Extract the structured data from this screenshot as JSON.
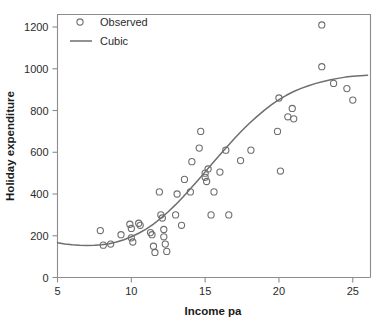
{
  "chart_data": {
    "type": "scatter",
    "title": "",
    "xlabel": "Income pa",
    "ylabel": "Holiday expenditure",
    "xlim": [
      5,
      26.2
    ],
    "ylim": [
      0,
      1260
    ],
    "xticks": [
      5,
      10,
      15,
      20,
      25
    ],
    "xtick_labels": [
      "5",
      "10",
      "15",
      "20",
      "25"
    ],
    "yticks": [
      0,
      200,
      400,
      600,
      800,
      1000,
      1200
    ],
    "ytick_labels": [
      "0",
      "200",
      "400",
      "600",
      "800",
      "1000",
      "1200"
    ],
    "grid": false,
    "legend_position": "top-left inside",
    "series": [
      {
        "name": "Observed",
        "type": "scatter",
        "marker": "open-circle",
        "color": "#6e6e6e",
        "points": [
          [
            7.9,
            225
          ],
          [
            8.1,
            155
          ],
          [
            8.6,
            160
          ],
          [
            9.3,
            205
          ],
          [
            9.9,
            255
          ],
          [
            10.0,
            235
          ],
          [
            10.0,
            190
          ],
          [
            10.1,
            170
          ],
          [
            10.5,
            260
          ],
          [
            10.6,
            250
          ],
          [
            11.3,
            215
          ],
          [
            11.4,
            205
          ],
          [
            11.5,
            150
          ],
          [
            11.6,
            120
          ],
          [
            11.9,
            410
          ],
          [
            12.0,
            300
          ],
          [
            12.1,
            285
          ],
          [
            12.2,
            230
          ],
          [
            12.2,
            195
          ],
          [
            12.3,
            160
          ],
          [
            12.4,
            125
          ],
          [
            13.0,
            300
          ],
          [
            13.1,
            400
          ],
          [
            13.4,
            250
          ],
          [
            13.6,
            470
          ],
          [
            14.0,
            410
          ],
          [
            14.1,
            555
          ],
          [
            14.6,
            620
          ],
          [
            14.7,
            700
          ],
          [
            15.0,
            480
          ],
          [
            15.0,
            500
          ],
          [
            15.1,
            460
          ],
          [
            15.2,
            520
          ],
          [
            15.4,
            300
          ],
          [
            15.6,
            410
          ],
          [
            16.0,
            505
          ],
          [
            16.4,
            610
          ],
          [
            16.6,
            300
          ],
          [
            17.4,
            560
          ],
          [
            18.1,
            610
          ],
          [
            19.9,
            700
          ],
          [
            20.0,
            860
          ],
          [
            20.1,
            510
          ],
          [
            20.6,
            770
          ],
          [
            20.9,
            810
          ],
          [
            21.0,
            760
          ],
          [
            22.9,
            1210
          ],
          [
            22.9,
            1010
          ],
          [
            23.7,
            930
          ],
          [
            24.6,
            905
          ],
          [
            25.0,
            850
          ]
        ]
      },
      {
        "name": "Cubic",
        "type": "line",
        "color": "#6e6e6e",
        "points": [
          [
            5.0,
            167
          ],
          [
            5.5,
            161
          ],
          [
            6.0,
            157
          ],
          [
            6.5,
            154
          ],
          [
            7.0,
            153
          ],
          [
            7.5,
            154
          ],
          [
            8.0,
            157
          ],
          [
            8.5,
            162
          ],
          [
            9.0,
            170
          ],
          [
            9.5,
            181
          ],
          [
            10.0,
            195
          ],
          [
            10.5,
            212
          ],
          [
            11.0,
            232
          ],
          [
            11.5,
            256
          ],
          [
            12.0,
            284
          ],
          [
            12.5,
            315
          ],
          [
            13.0,
            349
          ],
          [
            13.5,
            386
          ],
          [
            14.0,
            425
          ],
          [
            14.5,
            465
          ],
          [
            15.0,
            506
          ],
          [
            15.5,
            547
          ],
          [
            16.0,
            588
          ],
          [
            16.5,
            628
          ],
          [
            17.0,
            667
          ],
          [
            17.5,
            704
          ],
          [
            18.0,
            739
          ],
          [
            18.5,
            771
          ],
          [
            19.0,
            801
          ],
          [
            19.5,
            828
          ],
          [
            20.0,
            852
          ],
          [
            20.5,
            873
          ],
          [
            21.0,
            891
          ],
          [
            21.5,
            906
          ],
          [
            22.0,
            919
          ],
          [
            22.5,
            930
          ],
          [
            23.0,
            939
          ],
          [
            23.5,
            947
          ],
          [
            24.0,
            954
          ],
          [
            24.5,
            960
          ],
          [
            25.0,
            964
          ],
          [
            25.5,
            967
          ],
          [
            26.0,
            969
          ]
        ]
      }
    ],
    "legend": [
      {
        "label": "Observed",
        "marker": "open-circle"
      },
      {
        "label": "Cubic",
        "marker": "line"
      }
    ]
  }
}
